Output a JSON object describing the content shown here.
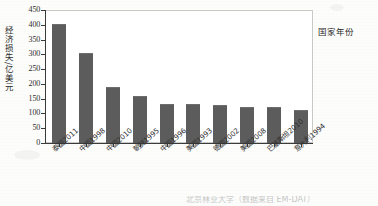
{
  "chart_data": {
    "type": "bar",
    "title": "",
    "xlabel": "国家年份",
    "ylabel": "经济损失/亿美元",
    "categories": [
      "泰国2011",
      "中国1998",
      "中国2010",
      "朝鲜1995",
      "中国1996",
      "美国1993",
      "德国2002",
      "美国2008",
      "巴基斯坦2010",
      "意大利1994"
    ],
    "values": [
      400,
      300,
      185,
      155,
      130,
      128,
      125,
      120,
      118,
      110
    ],
    "ylim": [
      0,
      450
    ],
    "ytick_values": [
      0,
      50,
      100,
      150,
      200,
      250,
      300,
      350,
      400,
      450
    ],
    "ytick_labels": [
      "0",
      "50",
      "100",
      "150",
      "200",
      "250",
      "300",
      "350",
      "400",
      "450"
    ],
    "grid": false,
    "legend": false,
    "bar_color": "#5c5c5c",
    "axis_color": "#3b3b3b",
    "frame_color": "#c9c9c6"
  },
  "caption": {
    "text": "北京林业大学（数据来自 EM-DAT）"
  }
}
